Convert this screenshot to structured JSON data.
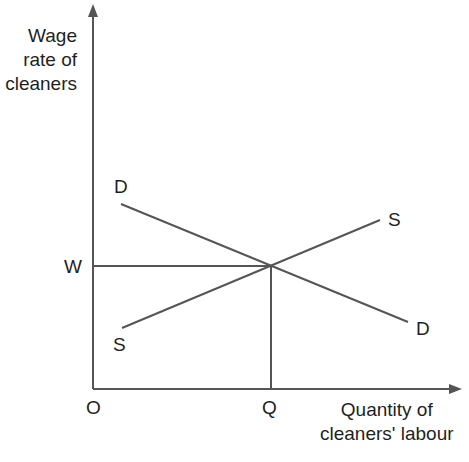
{
  "diagram": {
    "type": "supply-demand",
    "y_axis_label": [
      "Wage",
      "rate of",
      "cleaners"
    ],
    "x_axis_label": [
      "Quantity of",
      "cleaners' labour"
    ],
    "origin_label": "O",
    "equilibrium_wage_label": "W",
    "equilibrium_quantity_label": "Q",
    "demand": {
      "label_start": "D",
      "label_end": "D"
    },
    "supply": {
      "label_start": "S",
      "label_end": "S"
    },
    "line_color": "#555555"
  }
}
